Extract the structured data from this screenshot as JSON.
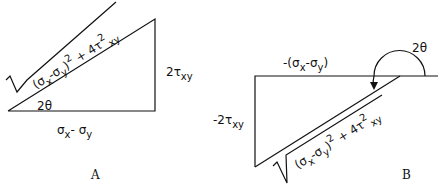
{
  "diagram": {
    "panel_a": {
      "label": "A",
      "hypotenuse": {
        "open": "(σ",
        "sx": "x",
        "mid": "-σ",
        "sy": "y",
        "close": ")",
        "sq1": "2",
        "plus": " + 4τ",
        "sq2": "2",
        "sxy": "xy"
      },
      "vertical_side": {
        "main": "2τ",
        "sub": "xy"
      },
      "horizontal_side": {
        "s1": "σ",
        "sx": "x",
        "minus": "- σ",
        "sy": "y"
      },
      "angle": "2θ"
    },
    "panel_b": {
      "label": "B",
      "hypotenuse": {
        "open": "(σ",
        "sx": "x",
        "mid": "-σ",
        "sy": "y",
        "close": ")",
        "sq1": "2",
        "plus": " + 4τ",
        "sq2": "2",
        "sxy": "xy"
      },
      "vertical_side": {
        "main": "-2τ",
        "sub": "xy"
      },
      "horizontal_side": {
        "pre": "-(σ",
        "sx": "x",
        "minus": "-σ",
        "sy": "y",
        "close": ")"
      },
      "angle": "2θ"
    },
    "colors": {
      "stroke": "#111111",
      "background": "#ffffff"
    }
  }
}
